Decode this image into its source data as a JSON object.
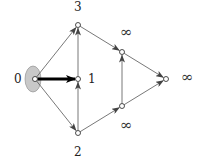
{
  "diagram": {
    "type": "directed-graph",
    "source_highlight_color": "#c8c8c8",
    "edge_color": "#555555",
    "thick_edge_color": "#000000",
    "nodes": [
      {
        "id": "n0",
        "label": "0",
        "x": 35,
        "y": 79,
        "label_x": 14,
        "label_y": 83
      },
      {
        "id": "n1",
        "label": "1",
        "x": 78,
        "y": 79,
        "label_x": 88,
        "label_y": 83
      },
      {
        "id": "n2",
        "label": "2",
        "x": 78,
        "y": 133,
        "label_x": 74,
        "label_y": 156
      },
      {
        "id": "n3",
        "label": "3",
        "x": 78,
        "y": 25,
        "label_x": 74,
        "label_y": 11
      },
      {
        "id": "n4",
        "label": "∞",
        "x": 122,
        "y": 52,
        "label_x": 120,
        "label_y": 37
      },
      {
        "id": "n5",
        "label": "∞",
        "x": 122,
        "y": 106,
        "label_x": 120,
        "label_y": 130
      },
      {
        "id": "n6",
        "label": "∞",
        "x": 166,
        "y": 79,
        "label_x": 181,
        "label_y": 82
      }
    ],
    "edges": [
      {
        "from": "n0",
        "to": "n3",
        "thick": false
      },
      {
        "from": "n0",
        "to": "n1",
        "thick": true
      },
      {
        "from": "n0",
        "to": "n2",
        "thick": false
      },
      {
        "from": "n1",
        "to": "n3",
        "thick": false
      },
      {
        "from": "n2",
        "to": "n1",
        "thick": false
      },
      {
        "from": "n3",
        "to": "n4",
        "thick": false
      },
      {
        "from": "n2",
        "to": "n5",
        "thick": false
      },
      {
        "from": "n5",
        "to": "n4",
        "thick": false
      },
      {
        "from": "n4",
        "to": "n6",
        "thick": false
      },
      {
        "from": "n5",
        "to": "n6",
        "thick": false
      }
    ]
  }
}
